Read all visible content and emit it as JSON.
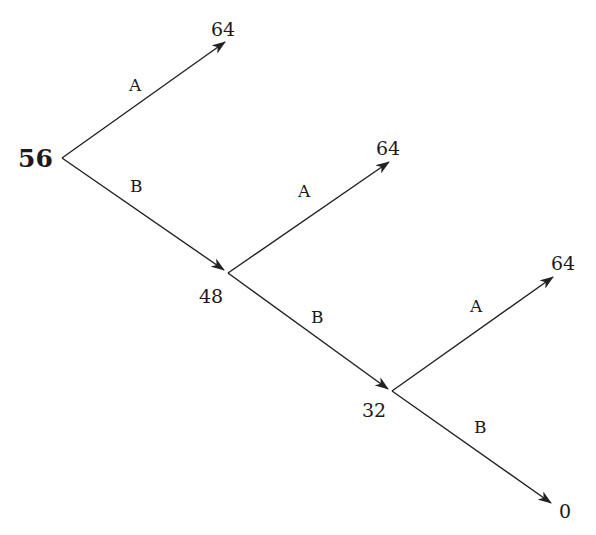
{
  "diagram": {
    "type": "decision-tree",
    "line_color": "#222222",
    "root": {
      "value": "56"
    },
    "nodes": [
      {
        "id": "n1",
        "value": "48"
      },
      {
        "id": "n2",
        "value": "32"
      }
    ],
    "leaves": [
      {
        "id": "l1",
        "value": "64"
      },
      {
        "id": "l2",
        "value": "64"
      },
      {
        "id": "l3",
        "value": "64"
      },
      {
        "id": "l4",
        "value": "0"
      }
    ],
    "edges": [
      {
        "from": "root",
        "to": "l1",
        "label": "A"
      },
      {
        "from": "root",
        "to": "n1",
        "label": "B"
      },
      {
        "from": "n1",
        "to": "l2",
        "label": "A"
      },
      {
        "from": "n1",
        "to": "n2",
        "label": "B"
      },
      {
        "from": "n2",
        "to": "l3",
        "label": "A"
      },
      {
        "from": "n2",
        "to": "l4",
        "label": "B"
      }
    ]
  }
}
